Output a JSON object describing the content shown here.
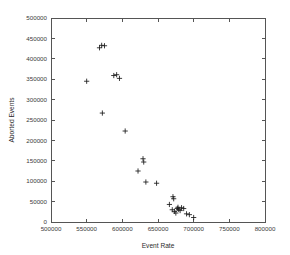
{
  "chart_data": {
    "type": "scatter",
    "title": "",
    "xlabel": "Event Rate",
    "ylabel": "Aborted Events",
    "xlim": [
      500000,
      800000
    ],
    "ylim": [
      0,
      500000
    ],
    "xticks": [
      500000,
      550000,
      600000,
      650000,
      700000,
      750000,
      800000
    ],
    "yticks": [
      0,
      50000,
      100000,
      150000,
      200000,
      250000,
      300000,
      350000,
      400000,
      450000,
      500000
    ],
    "xtick_labels": [
      "500000",
      "550000",
      "600000",
      "650000",
      "700000",
      "750000",
      "800000"
    ],
    "ytick_labels": [
      "0",
      "50000",
      "100000",
      "150000",
      "200000",
      "250000",
      "300000",
      "350000",
      "400000",
      "450000",
      "500000"
    ],
    "grid": false,
    "legend": false,
    "marker": "plus",
    "marker_color": "#1a1a1a",
    "series": [
      {
        "name": "aborted events",
        "points": [
          [
            550000,
            345000
          ],
          [
            568000,
            427000
          ],
          [
            571000,
            433000
          ],
          [
            575000,
            432000
          ],
          [
            572000,
            267000
          ],
          [
            588000,
            359000
          ],
          [
            592000,
            361000
          ],
          [
            596000,
            352000
          ],
          [
            604000,
            223000
          ],
          [
            622000,
            125000
          ],
          [
            629000,
            155000
          ],
          [
            630000,
            147000
          ],
          [
            633000,
            98000
          ],
          [
            648000,
            95000
          ],
          [
            666000,
            43000
          ],
          [
            671000,
            62000
          ],
          [
            672000,
            57000
          ],
          [
            670000,
            30000
          ],
          [
            673000,
            26000
          ],
          [
            675000,
            22000
          ],
          [
            677000,
            33000
          ],
          [
            678000,
            36000
          ],
          [
            679000,
            31000
          ],
          [
            681000,
            28000
          ],
          [
            683000,
            35000
          ],
          [
            686000,
            33000
          ],
          [
            690000,
            20000
          ],
          [
            694000,
            18000
          ],
          [
            700000,
            11000
          ]
        ]
      }
    ]
  },
  "plot_geometry": {
    "left": 51,
    "right": 265,
    "top": 18,
    "bottom": 222
  }
}
